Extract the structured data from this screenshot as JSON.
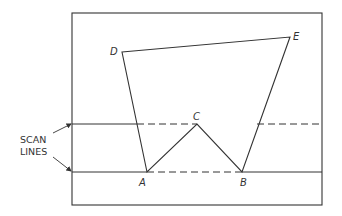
{
  "diagram": {
    "colors": {
      "stroke": "#333333",
      "background": "#ffffff"
    },
    "frame": {
      "x": 72,
      "y": 13,
      "width": 250,
      "height": 192
    },
    "vertices": {
      "A": {
        "label": "A",
        "x": 147,
        "y": 172
      },
      "B": {
        "label": "B",
        "x": 242,
        "y": 172
      },
      "C": {
        "label": "C",
        "x": 197,
        "y": 124
      },
      "D": {
        "label": "D",
        "x": 122,
        "y": 52
      },
      "E": {
        "label": "E",
        "x": 290,
        "y": 37
      }
    },
    "polygon_order": [
      "D",
      "E",
      "B",
      "C",
      "A"
    ],
    "scan_lines": {
      "label_line1": "SCAN",
      "label_line2": "LINES",
      "upper": {
        "y": 124,
        "segments": [
          {
            "x1": 72,
            "x2": 137,
            "style": "solid"
          },
          {
            "x1": 137,
            "x2": 197,
            "style": "dashed"
          },
          {
            "x1": 257,
            "x2": 322,
            "style": "dashed"
          }
        ]
      },
      "lower": {
        "y": 172,
        "segments": [
          {
            "x1": 72,
            "x2": 147,
            "style": "solid"
          },
          {
            "x1": 147,
            "x2": 242,
            "style": "dashed"
          },
          {
            "x1": 242,
            "x2": 322,
            "style": "solid"
          }
        ]
      }
    }
  }
}
